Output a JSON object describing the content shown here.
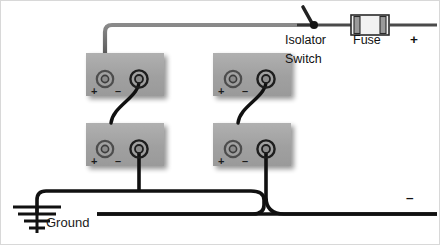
{
  "diagram": {
    "colors": {
      "background": "#ffffff",
      "battery_body": "#a2a2a2",
      "battery_shadow": "#c9c9c9",
      "positive_wire": "#666666",
      "negative_wire": "#111111",
      "terminal_ring": "#4a4a4a",
      "text": "#111111"
    },
    "labels": {
      "isolator_line1": "Isolator",
      "isolator_line2": "Switch",
      "fuse": "Fuse",
      "output_positive": "+",
      "output_negative": "–",
      "ground": "Ground"
    },
    "batteries": [
      {
        "id": "battery-top-left",
        "position": "top-left",
        "terminals": [
          {
            "polarity": "+",
            "sign": "+",
            "wire": "positive-bus-riser"
          },
          {
            "polarity": "-",
            "sign": "–",
            "wire": "link-to-lower-left-positive"
          }
        ]
      },
      {
        "id": "battery-top-right",
        "position": "top-right",
        "terminals": [
          {
            "polarity": "+",
            "sign": "+",
            "wire": "positive-bus-riser"
          },
          {
            "polarity": "-",
            "sign": "–",
            "wire": "link-to-lower-right-positive"
          }
        ]
      },
      {
        "id": "battery-bottom-left",
        "position": "bottom-left",
        "terminals": [
          {
            "polarity": "+",
            "sign": "+",
            "wire": "link-from-upper-left-negative"
          },
          {
            "polarity": "-",
            "sign": "–",
            "wire": "negative-bus-drop"
          }
        ]
      },
      {
        "id": "battery-bottom-right",
        "position": "bottom-right",
        "terminals": [
          {
            "polarity": "+",
            "sign": "+",
            "wire": "link-from-upper-right-negative"
          },
          {
            "polarity": "-",
            "sign": "–",
            "wire": "negative-bus-drop"
          }
        ]
      }
    ],
    "components": [
      {
        "id": "isolator-switch",
        "type": "knife-switch",
        "state": "open",
        "label": "Isolator Switch"
      },
      {
        "id": "fuse",
        "type": "fuse",
        "label": "Fuse"
      },
      {
        "id": "ground",
        "type": "earth-ground",
        "label": "Ground",
        "bars": 4
      }
    ],
    "buses": [
      {
        "id": "positive-bus",
        "polarity": "+",
        "color": "#666666",
        "runs": "top rail to isolator switch, fuse, then + output"
      },
      {
        "id": "ground-bus",
        "polarity": "-",
        "color": "#111111",
        "runs": "battery negatives to ground symbol"
      },
      {
        "id": "negative-output-bus",
        "polarity": "-",
        "color": "#111111",
        "runs": "battery negatives to - output at right"
      }
    ]
  }
}
